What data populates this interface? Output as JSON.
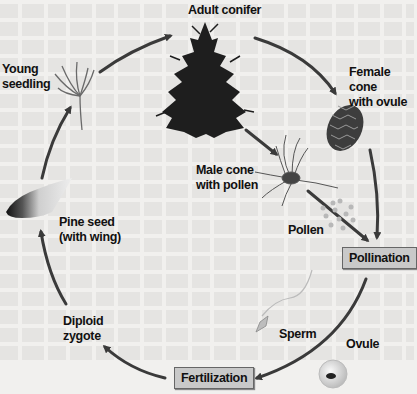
{
  "diagram": {
    "stages": {
      "adult_conifer": "Adult conifer",
      "female_cone": "Female cone\nwith ovule",
      "male_cone": "Male cone\nwith pollen",
      "pollen": "Pollen",
      "sperm": "Sperm",
      "ovule": "Ovule",
      "diploid_zygote": "Diploid\nzygote",
      "pine_seed": "Pine seed\n(with wing)",
      "young_seedling": "Young\nseedling"
    },
    "process_boxes": {
      "pollination": "Pollination",
      "fertilization": "Fertilization"
    },
    "cycle_order": [
      "Adult conifer",
      "Female cone with ovule",
      "Male cone with pollen",
      "Pollen",
      "Pollination",
      "Sperm",
      "Ovule",
      "Fertilization",
      "Diploid zygote",
      "Pine seed (with wing)",
      "Young seedling"
    ],
    "colors": {
      "arrow": "#3a3a3a",
      "box_fill": "#c9c9c9",
      "tree": "#1e1e1e",
      "background": "#f1f0ee"
    }
  }
}
